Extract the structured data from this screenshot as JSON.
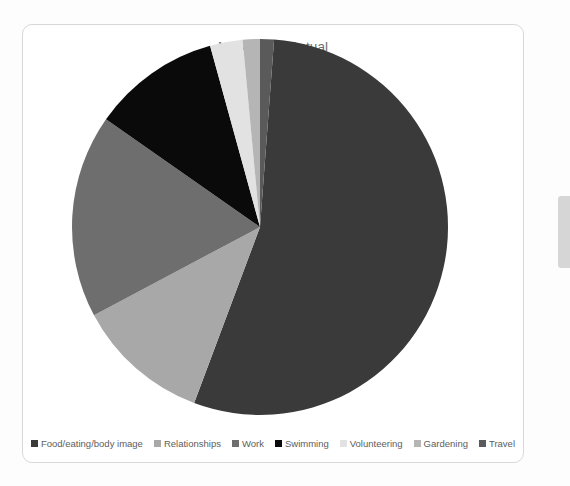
{
  "card": {
    "title": "My Values--Actual"
  },
  "legend": {
    "items": [
      {
        "label": "Food/eating/body image",
        "color": "#3a3a3a"
      },
      {
        "label": "Relationships",
        "color": "#a8a8a8"
      },
      {
        "label": "Work",
        "color": "#6e6e6e"
      },
      {
        "label": "Swimming",
        "color": "#0a0a0a"
      },
      {
        "label": "Volunteering",
        "color": "#e2e2e2"
      },
      {
        "label": "Gardening",
        "color": "#b5b5b5"
      },
      {
        "label": "Travel",
        "color": "#5a5a5a"
      }
    ]
  },
  "chart_data": {
    "type": "pie",
    "title": "My Values--Actual",
    "xlabel": "",
    "ylabel": "",
    "grid": false,
    "legend_position": "bottom",
    "start_angle_deg": 0,
    "direction": "clockwise",
    "categories": [
      "Food/eating/body image",
      "Relationships",
      "Work",
      "Swimming",
      "Volunteering",
      "Gardening",
      "Travel"
    ],
    "values": [
      54.5,
      11.5,
      17.5,
      11,
      2.8,
      1.5,
      1.2
    ],
    "unit": "percent",
    "colors": [
      "#3a3a3a",
      "#a8a8a8",
      "#6e6e6e",
      "#0a0a0a",
      "#e2e2e2",
      "#b5b5b5",
      "#5a5a5a"
    ],
    "slices": [
      {
        "label": "Food/eating/body image",
        "value": 54.5,
        "color": "#3a3a3a",
        "start_deg": 4.3,
        "end_deg": 200.5
      },
      {
        "label": "Relationships",
        "value": 11.5,
        "color": "#a8a8a8",
        "start_deg": 200.5,
        "end_deg": 242.0
      },
      {
        "label": "Work",
        "value": 17.5,
        "color": "#6e6e6e",
        "start_deg": 242.0,
        "end_deg": 305.0
      },
      {
        "label": "Swimming",
        "value": 11.0,
        "color": "#0a0a0a",
        "start_deg": 305.0,
        "end_deg": 344.6
      },
      {
        "label": "Volunteering",
        "value": 2.8,
        "color": "#e2e2e2",
        "start_deg": 344.6,
        "end_deg": 354.7
      },
      {
        "label": "Gardening",
        "value": 1.5,
        "color": "#b5b5b5",
        "start_deg": 354.7,
        "end_deg": 360.0
      },
      {
        "label": "Travel",
        "value": 1.2,
        "color": "#5a5a5a",
        "start_deg": 0.0,
        "end_deg": 4.3
      }
    ]
  }
}
